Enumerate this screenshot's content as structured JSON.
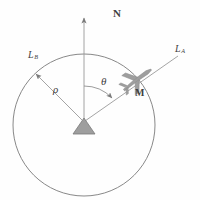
{
  "figure": {
    "name": "radar-bearing-geometry",
    "labels": {
      "north": "N",
      "line_a": "L",
      "line_a_sub": "A",
      "line_b": "L",
      "line_b_sub": "B",
      "range": "ρ",
      "angle": "θ",
      "target": "M"
    },
    "colors": {
      "stroke": "#7a7a7a",
      "fill": "#9e9e9e",
      "text": "#3f3f3f",
      "background": "#ffffff"
    },
    "geometry": {
      "circle_center_x": 84,
      "circle_center_y": 125,
      "circle_radius": 71,
      "north_axis_top_y": 15,
      "target_x": 138,
      "target_y": 80,
      "bearing_degrees": 50
    }
  }
}
